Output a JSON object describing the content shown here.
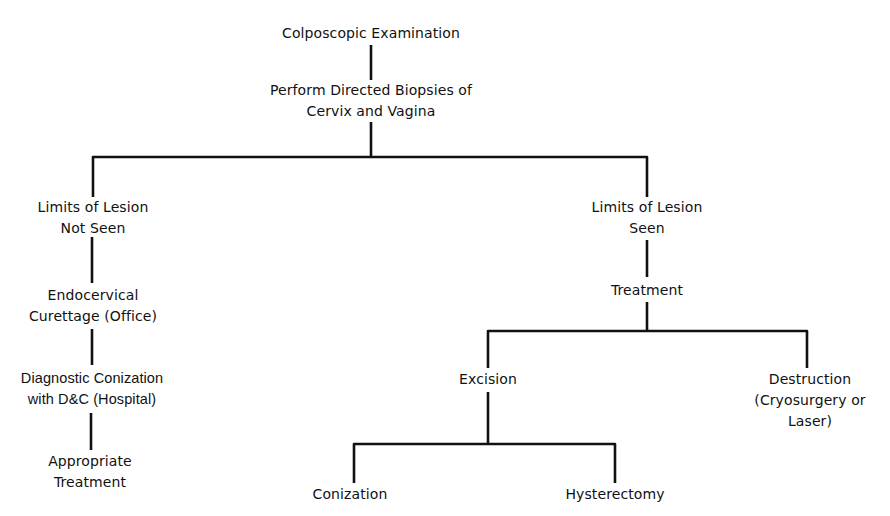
{
  "diagram": {
    "type": "flowchart",
    "line_color": "#111111",
    "nodes": [
      {
        "id": "colposcopic",
        "lines": [
          "Colposcopic Examination"
        ]
      },
      {
        "id": "biopsies",
        "lines": [
          "Perform Directed Biopsies of",
          "Cervix and Vagina"
        ]
      },
      {
        "id": "not-seen",
        "lines": [
          "Limits of Lesion",
          "Not Seen"
        ]
      },
      {
        "id": "seen",
        "lines": [
          "Limits of Lesion",
          "Seen"
        ]
      },
      {
        "id": "endocervical",
        "lines": [
          "Endocervical",
          "Curettage (Office)"
        ]
      },
      {
        "id": "conization-dc",
        "lines": [
          "Diagnostic Conization",
          "with D&C (Hospital)"
        ]
      },
      {
        "id": "appropriate",
        "lines": [
          "Appropriate",
          "Treatment"
        ]
      },
      {
        "id": "treatment",
        "lines": [
          "Treatment"
        ]
      },
      {
        "id": "excision",
        "lines": [
          "Excision"
        ]
      },
      {
        "id": "destruction",
        "lines": [
          "Destruction",
          "(Cryosurgery or",
          "Laser)"
        ]
      },
      {
        "id": "conization",
        "lines": [
          "Conization"
        ]
      },
      {
        "id": "hysterectomy",
        "lines": [
          "Hysterectomy"
        ]
      }
    ],
    "edges": [
      {
        "from": "colposcopic",
        "to": "biopsies"
      },
      {
        "from": "biopsies",
        "to": "not-seen"
      },
      {
        "from": "biopsies",
        "to": "seen"
      },
      {
        "from": "not-seen",
        "to": "endocervical"
      },
      {
        "from": "endocervical",
        "to": "conization-dc"
      },
      {
        "from": "conization-dc",
        "to": "appropriate"
      },
      {
        "from": "seen",
        "to": "treatment"
      },
      {
        "from": "treatment",
        "to": "excision"
      },
      {
        "from": "treatment",
        "to": "destruction"
      },
      {
        "from": "excision",
        "to": "conization"
      },
      {
        "from": "excision",
        "to": "hysterectomy"
      }
    ]
  }
}
